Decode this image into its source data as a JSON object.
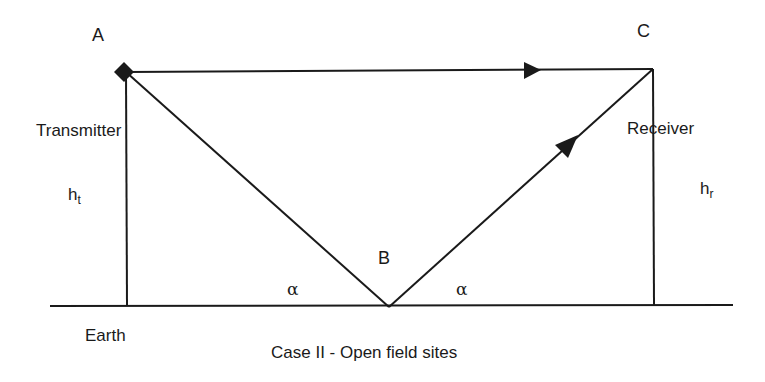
{
  "diagram": {
    "type": "ray-propagation",
    "caption": "Case II - Open field sites",
    "points": {
      "A": {
        "label": "A",
        "x": 125,
        "y": 72
      },
      "B": {
        "label": "B",
        "x": 389,
        "y": 307
      },
      "C": {
        "label": "C",
        "x": 653,
        "y": 69
      }
    },
    "labels": {
      "transmitter": "Transmitter",
      "receiver": "Receiver",
      "earth": "Earth",
      "ht_base": "h",
      "ht_sub": "t",
      "hr_base": "h",
      "hr_sub": "r",
      "alpha_left": "α",
      "alpha_right": "α"
    },
    "edges": [
      {
        "name": "direct-path",
        "from": "A",
        "to": "C",
        "arrow": true
      },
      {
        "name": "incident-path",
        "from": "A",
        "to": "B",
        "arrow": false
      },
      {
        "name": "reflected-path",
        "from": "B",
        "to": "C",
        "arrow": true
      },
      {
        "name": "transmitter-mast",
        "from": "A",
        "to": "ground",
        "arrow": false
      },
      {
        "name": "receiver-mast",
        "from": "C",
        "to": "ground",
        "arrow": false
      }
    ],
    "colors": {
      "line": "#1a1a1a",
      "background": "#ffffff"
    }
  }
}
